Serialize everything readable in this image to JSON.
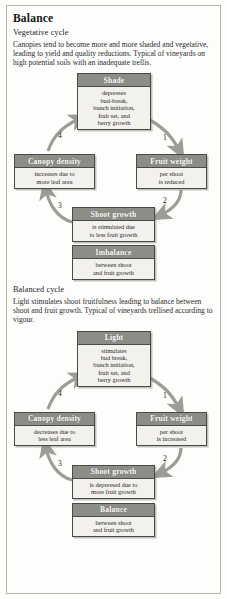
{
  "page": {
    "title": "Balance"
  },
  "sections": [
    {
      "id": "vegetative",
      "subhead": "Vegetative cycle",
      "paragraph": "Canopies tend to become more and more shaded and vegetative, leading to yield and quality reductions. Typical of vineyards on high potential soils with an inadequate trellis.",
      "nodes": [
        {
          "id": "shade",
          "header": "Shade",
          "body": "depresses\nbud-break,\nbunch initiation,\nfruit set, and\nberry growth"
        },
        {
          "id": "fruit-weight",
          "header": "Fruit weight",
          "body": "per shoot\nis reduced"
        },
        {
          "id": "shoot-growth",
          "header": "Shoot growth",
          "body": "is stimulated due\nto less fruit growth"
        },
        {
          "id": "canopy-density",
          "header": "Canopy density",
          "body": "increases due to\nmore leaf area"
        },
        {
          "id": "imbalance",
          "header": "Imbalance",
          "body": "between shoot\nand fruit growth"
        }
      ],
      "arrow_labels": [
        "1",
        "2",
        "3",
        "4"
      ]
    },
    {
      "id": "balanced",
      "subhead": "Balanced cycle",
      "paragraph": "Light stimulates shoot fruitfulness leading to balance between shoot and fruit growth. Typical of vineyards trellised according to vigour.",
      "nodes": [
        {
          "id": "light",
          "header": "Light",
          "body": "stimulates\nbud break,\nbunch initiation,\nfruit set, and\nberry growth"
        },
        {
          "id": "fruit-weight",
          "header": "Fruit weight",
          "body": "per shoot\nis increased"
        },
        {
          "id": "shoot-growth",
          "header": "Shoot growth",
          "body": "is depressed due to\nmore fruit growth"
        },
        {
          "id": "canopy-density",
          "header": "Canopy density",
          "body": "decreases due to\nless leaf area"
        },
        {
          "id": "balance",
          "header": "Balance",
          "body": "between shoot\nand fruit growth"
        }
      ],
      "arrow_labels": [
        "1",
        "2",
        "3",
        "4"
      ]
    }
  ],
  "colors": {
    "header_fill": "#8d8d87",
    "node_fill": "#f2f1ee",
    "node_border": "#4a4a4a",
    "arrow": "#9d9c96",
    "page_border": "#b9b5ad"
  }
}
